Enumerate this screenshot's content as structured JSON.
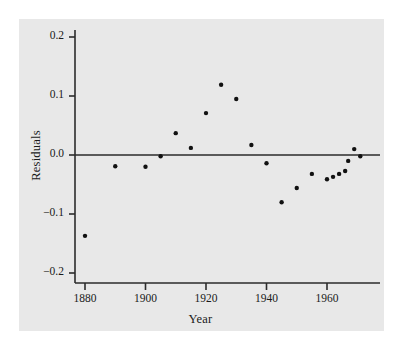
{
  "chart_data": {
    "type": "scatter",
    "title": "",
    "xlabel": "Year",
    "ylabel": "Residuals",
    "xlim": [
      1873,
      1976
    ],
    "ylim": [
      -0.215,
      0.222
    ],
    "grid": false,
    "legend": null,
    "xticks": [
      1880,
      1900,
      1920,
      1940,
      1960
    ],
    "xtick_labels": [
      "1880",
      "1900",
      "1920",
      "1940",
      "1960"
    ],
    "yticks": [
      0.2,
      0.1,
      0.0,
      -0.1,
      -0.2
    ],
    "ytick_labels": [
      "0.2",
      "0.1",
      "0.0",
      "−0.1",
      "−0.2"
    ],
    "reference_line": {
      "y": 0.0,
      "orientation": "horizontal"
    },
    "marker": {
      "shape": "circle",
      "color": "#111111",
      "size": 4.4
    },
    "x": [
      1880,
      1890,
      1900,
      1905,
      1910,
      1915,
      1920,
      1925,
      1930,
      1935,
      1940,
      1945,
      1950,
      1955,
      1960,
      1962,
      1964,
      1966,
      1967,
      1969,
      1971
    ],
    "y": [
      -0.137,
      -0.019,
      -0.02,
      -0.002,
      0.037,
      0.012,
      0.071,
      0.119,
      0.095,
      0.017,
      -0.014,
      -0.08,
      -0.056,
      -0.032,
      -0.041,
      -0.037,
      -0.032,
      -0.027,
      -0.01,
      0.01,
      -0.002
    ],
    "points": [
      {
        "x": 1880,
        "y": -0.137
      },
      {
        "x": 1890,
        "y": -0.019
      },
      {
        "x": 1900,
        "y": -0.02
      },
      {
        "x": 1905,
        "y": -0.002
      },
      {
        "x": 1910,
        "y": 0.037
      },
      {
        "x": 1915,
        "y": 0.012
      },
      {
        "x": 1920,
        "y": 0.071
      },
      {
        "x": 1925,
        "y": 0.119
      },
      {
        "x": 1930,
        "y": 0.095
      },
      {
        "x": 1935,
        "y": 0.017
      },
      {
        "x": 1940,
        "y": -0.014
      },
      {
        "x": 1945,
        "y": -0.08
      },
      {
        "x": 1950,
        "y": -0.056
      },
      {
        "x": 1955,
        "y": -0.032
      },
      {
        "x": 1960,
        "y": -0.041
      },
      {
        "x": 1962,
        "y": -0.037
      },
      {
        "x": 1964,
        "y": -0.032
      },
      {
        "x": 1966,
        "y": -0.027
      },
      {
        "x": 1967,
        "y": -0.01
      },
      {
        "x": 1969,
        "y": 0.01
      },
      {
        "x": 1971,
        "y": -0.002
      }
    ]
  },
  "colors": {
    "figure_background": "#ffffff",
    "plot_background": "#e8e8e8",
    "axis": "#2b2b2b",
    "marker": "#111111",
    "text": "#1a1a1a"
  }
}
